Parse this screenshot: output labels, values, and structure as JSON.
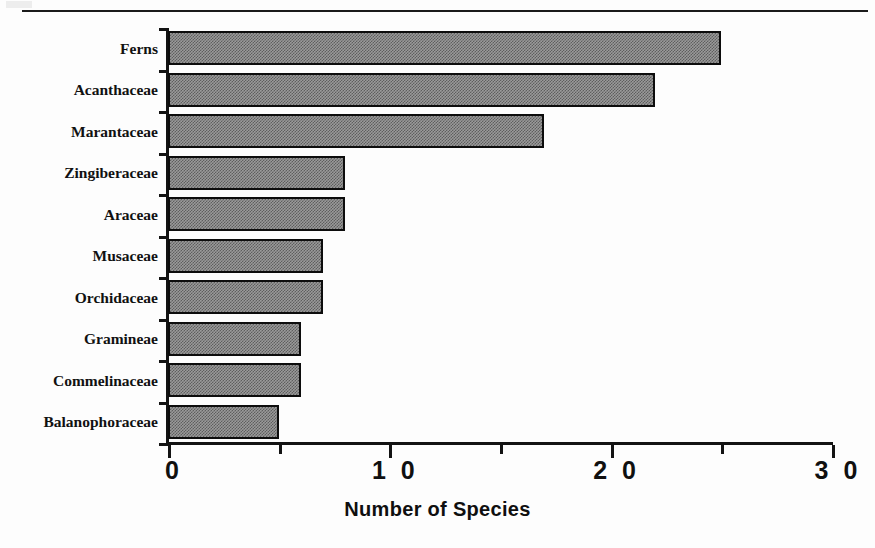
{
  "chart_data": {
    "type": "bar",
    "orientation": "horizontal",
    "title": "",
    "xlabel": "Number of Species",
    "ylabel": "",
    "categories": [
      "Ferns",
      "Acanthaceae",
      "Marantaceae",
      "Zingiberaceae",
      "Araceae",
      "Musaceae",
      "Orchidaceae",
      "Gramineae",
      "Commelinaceae",
      "Balanophoraceae"
    ],
    "values": [
      25,
      22,
      17,
      8,
      8,
      7,
      7,
      6,
      6,
      5
    ],
    "xlim": [
      0,
      30
    ],
    "xticks": [
      0,
      10,
      20,
      30
    ],
    "xtick_labels": [
      "0",
      "1 0",
      "2 0",
      "3 0"
    ],
    "xminor_ticks": [
      5,
      15,
      25
    ],
    "grid": false,
    "legend": null,
    "bar_fill": "#9a9a9a",
    "bar_pattern": "checkerboard-dither",
    "bar_edge_color": "#0d0d0d",
    "axis_color": "#131313",
    "background": "#ffffff"
  },
  "figure": {
    "top_rule": true,
    "category_label_font": "serif-bold",
    "tick_label_font": "sans-bold"
  }
}
